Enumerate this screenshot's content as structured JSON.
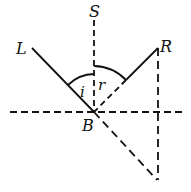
{
  "diagram": {
    "type": "reflection-geometry",
    "labels": {
      "S": "S",
      "L": "L",
      "R": "R",
      "B": "B",
      "i": "i",
      "r": "r"
    },
    "colors": {
      "stroke": "#111111",
      "background": "#ffffff"
    }
  }
}
